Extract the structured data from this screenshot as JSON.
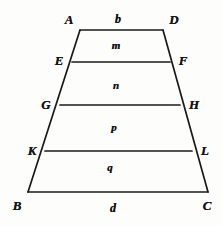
{
  "figure": {
    "type": "geometric-diagram",
    "shape": "trapezoid",
    "stroke_color": "#1a1a1a",
    "background_color": "#fdfdfb",
    "vertices": [
      {
        "id": "A",
        "label": "A",
        "x": 80,
        "y": 30,
        "label_x": 69,
        "label_y": 19
      },
      {
        "id": "D",
        "label": "D",
        "x": 163,
        "y": 30,
        "label_x": 174,
        "label_y": 19
      },
      {
        "id": "E",
        "label": "E",
        "x": 72,
        "y": 62,
        "label_x": 59,
        "label_y": 60
      },
      {
        "id": "F",
        "label": "F",
        "x": 170,
        "y": 62,
        "label_x": 183,
        "label_y": 60
      },
      {
        "id": "G",
        "label": "G",
        "x": 60,
        "y": 105,
        "label_x": 46,
        "label_y": 104
      },
      {
        "id": "H",
        "label": "H",
        "x": 180,
        "y": 105,
        "label_x": 194,
        "label_y": 104
      },
      {
        "id": "K",
        "label": "K",
        "x": 45,
        "y": 151,
        "label_x": 32,
        "label_y": 150
      },
      {
        "id": "L",
        "label": "L",
        "x": 192,
        "y": 151,
        "label_x": 205,
        "label_y": 150
      },
      {
        "id": "B",
        "label": "B",
        "x": 28,
        "y": 192,
        "label_x": 17,
        "label_y": 205
      },
      {
        "id": "C",
        "label": "C",
        "x": 208,
        "y": 192,
        "label_x": 207,
        "label_y": 205
      }
    ],
    "edges": [
      {
        "name": "top-edge-AD",
        "from": "A",
        "to": "D"
      },
      {
        "name": "left-edge-AB",
        "from": "A",
        "to": "B"
      },
      {
        "name": "right-edge-DC",
        "from": "D",
        "to": "C"
      },
      {
        "name": "bottom-edge-BC",
        "from": "B",
        "to": "C"
      },
      {
        "name": "divider-EF",
        "from": "E",
        "to": "F"
      },
      {
        "name": "divider-GH",
        "from": "G",
        "to": "H"
      },
      {
        "name": "divider-KL",
        "from": "K",
        "to": "L"
      }
    ],
    "side_labels": [
      {
        "id": "b",
        "label": "b",
        "x": 118,
        "y": 19,
        "desc": "top-side-length"
      },
      {
        "id": "d",
        "label": "d",
        "x": 113,
        "y": 208,
        "desc": "bottom-side-length"
      }
    ],
    "region_labels": [
      {
        "id": "m",
        "label": "m",
        "x": 116,
        "y": 45,
        "desc": "band-AD-EF"
      },
      {
        "id": "n",
        "label": "n",
        "x": 116,
        "y": 85,
        "desc": "band-EF-GH"
      },
      {
        "id": "p",
        "label": "p",
        "x": 114,
        "y": 127,
        "desc": "band-GH-KL"
      },
      {
        "id": "q",
        "label": "q",
        "x": 110,
        "y": 167,
        "desc": "band-KL-BC"
      }
    ]
  }
}
